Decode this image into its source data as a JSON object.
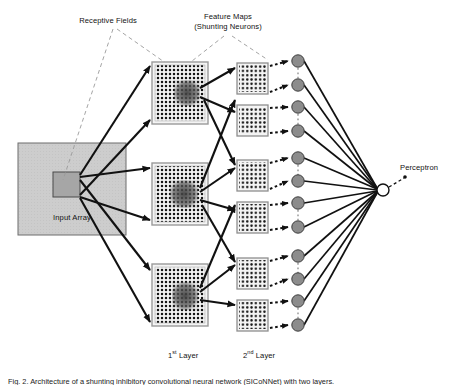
{
  "figure": {
    "caption": "Fig. 2.  Architecture of a shunting inhibitory convolutional neural network (SICoNNet) with two layers.",
    "labels": {
      "receptive_fields": "Receptive Fields",
      "feature_maps_line1": "Feature Maps",
      "feature_maps_line2": "(Shunting Neurons)",
      "input_array": "Input Array",
      "perceptron": "Perceptron",
      "first_layer_prefix": "1",
      "first_layer_sup": "st",
      "first_layer_suffix": " Layer",
      "second_layer_prefix": "2",
      "second_layer_sup": "nd",
      "second_layer_suffix": " Layer"
    }
  },
  "colors": {
    "input_array_fill": "#cccccc",
    "input_array_stroke": "#6d6d6d",
    "receptive_field_fill": "#a6a6a6",
    "receptive_field_stroke": "#4a4a4a",
    "feature_map_fill": "#f2f2f2",
    "feature_map_stroke": "#8c8c8c",
    "dot_color": "#1a1a1a",
    "dark_patch": "#4d4d4d",
    "neuron_fill": "#8c8c8c",
    "neuron_stroke": "#3a3a3a",
    "perceptron_fill": "#ffffff",
    "perceptron_stroke": "#1a1a1a",
    "solid_connection": "#111111",
    "dashed_connection": "#111111",
    "leader_line": "#8a8a8a"
  },
  "network": {
    "input_array": {
      "x": 18,
      "y": 143,
      "width": 108,
      "height": 92,
      "receptive_field": {
        "x": 53,
        "y": 172,
        "width": 27,
        "height": 25
      }
    },
    "layer1": {
      "label": "1st Layer",
      "map_count": 3,
      "map_width": 56,
      "map_height": 62,
      "x": 152,
      "dot_grid": {
        "cols": 14,
        "rows": 15,
        "spacing": 4
      },
      "maps": [
        {
          "y": 62,
          "dark_patch": {
            "dx": 22,
            "dy": 18,
            "w": 24,
            "h": 24
          }
        },
        {
          "y": 163,
          "dark_patch": {
            "dx": 18,
            "dy": 18,
            "w": 26,
            "h": 26
          }
        },
        {
          "y": 264,
          "dark_patch": {
            "dx": 20,
            "dy": 18,
            "w": 24,
            "h": 26
          }
        }
      ]
    },
    "layer2": {
      "label": "2nd Layer",
      "map_count": 6,
      "map_width": 31,
      "map_height": 31,
      "x": 237,
      "dot_grid": {
        "cols": 7,
        "rows": 7,
        "spacing": 4.3
      },
      "maps_y": [
        63,
        105,
        160,
        202,
        258,
        300
      ]
    },
    "shunting_neurons": {
      "count": 12,
      "radius": 6.2,
      "cx": 298,
      "cy": [
        61,
        85,
        107,
        131,
        158,
        181,
        203,
        227,
        256,
        279,
        301,
        325
      ]
    },
    "perceptron": {
      "cx": 383,
      "cy": 190,
      "radius": 6.0,
      "label_x": 415,
      "label_y": 168
    }
  },
  "annotations": {
    "receptive_fields_label": {
      "x": 108,
      "y": 20
    },
    "feature_maps_label": {
      "x": 228,
      "y": 16
    },
    "input_array_label": {
      "x": 72,
      "y": 216
    },
    "layer1_label": {
      "x": 180,
      "y": 351
    },
    "layer2_label": {
      "x": 253,
      "y": 351
    }
  }
}
